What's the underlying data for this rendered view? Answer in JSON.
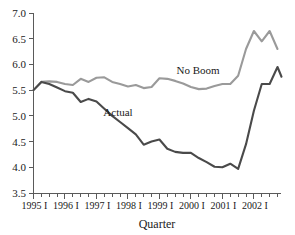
{
  "chart_data": {
    "type": "line",
    "title": "",
    "xlabel": "Quarter",
    "ylabel": "",
    "ylim": [
      3.5,
      7.0
    ],
    "ytick_step": 0.5,
    "yticks": [
      "3.5",
      "4.0",
      "4.5",
      "5.0",
      "5.5",
      "6.0",
      "6.5",
      "7.0"
    ],
    "ytick_values": [
      3.5,
      4.0,
      4.5,
      5.0,
      5.5,
      6.0,
      6.5,
      7.0
    ],
    "grid": false,
    "legend_position": "inline-annotation",
    "xticks": [
      "1995 I",
      "1996 I",
      "1997 I",
      "1998 I",
      "1999 I",
      "2000 I",
      "2001 I",
      "2002 I"
    ],
    "x_minor_per_major": 4,
    "x_count": 32,
    "x": [
      "1995 I",
      "1995 II",
      "1995 III",
      "1995 IV",
      "1996 I",
      "1996 II",
      "1996 III",
      "1996 IV",
      "1997 I",
      "1997 II",
      "1997 III",
      "1997 IV",
      "1998 I",
      "1998 II",
      "1998 III",
      "1998 IV",
      "1999 I",
      "1999 II",
      "1999 III",
      "1999 IV",
      "2000 I",
      "2000 II",
      "2000 III",
      "2000 IV",
      "2001 I",
      "2001 II",
      "2001 III",
      "2001 IV",
      "2002 I",
      "2002 II",
      "2002 III",
      "2002 IV"
    ],
    "series": [
      {
        "name": "No Boom",
        "color": "#9a9a9a",
        "label": "No Boom",
        "values": [
          5.5,
          5.66,
          5.67,
          5.66,
          5.62,
          5.6,
          5.72,
          5.66,
          5.74,
          5.75,
          5.66,
          5.62,
          5.57,
          5.6,
          5.54,
          5.56,
          5.73,
          5.72,
          5.68,
          5.63,
          5.56,
          5.52,
          5.53,
          5.58,
          5.62,
          5.62,
          5.78,
          6.3,
          6.65,
          6.45,
          6.65,
          6.3
        ]
      },
      {
        "name": "Actual",
        "color": "#4a4a4a",
        "label": "Actual",
        "values": [
          5.5,
          5.66,
          5.62,
          5.55,
          5.48,
          5.45,
          5.27,
          5.33,
          5.28,
          5.14,
          5.0,
          4.88,
          4.76,
          4.64,
          4.44,
          4.5,
          4.54,
          4.36,
          4.3,
          4.28,
          4.28,
          4.18,
          4.1,
          4.01,
          4.0,
          4.07,
          3.97,
          4.45,
          5.1,
          5.62,
          5.62,
          5.95
        ],
        "end_value": 5.76
      }
    ],
    "annotations": [
      {
        "text": "No Boom",
        "series": "No Boom",
        "x_px": 198,
        "y_px": 74
      },
      {
        "text": "Actual",
        "series": "Actual",
        "x_px": 118,
        "y_px": 116
      }
    ]
  }
}
